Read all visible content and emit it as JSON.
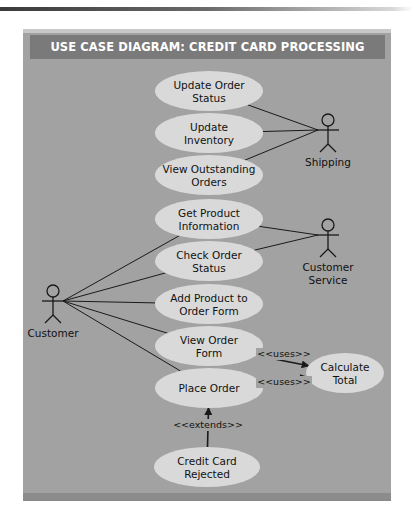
{
  "diagram": {
    "title": "USE CASE DIAGRAM: CREDIT CARD PROCESSING",
    "colors": {
      "frame": "#a2a2a2",
      "title_bar": "#7a7a7a",
      "title_text": "#ffffff",
      "use_case_fill": "#d9d9d9",
      "line": "#1a1a1a"
    },
    "actors": [
      {
        "id": "shipping",
        "label_lines": [
          "Shipping"
        ]
      },
      {
        "id": "customer-service",
        "label_lines": [
          "Customer",
          "Service"
        ]
      },
      {
        "id": "customer",
        "label_lines": [
          "Customer"
        ]
      }
    ],
    "use_cases": [
      {
        "id": "update-order-status",
        "label_lines": [
          "Update Order",
          "Status"
        ]
      },
      {
        "id": "update-inventory",
        "label_lines": [
          "Update",
          "Inventory"
        ]
      },
      {
        "id": "view-outstanding-orders",
        "label_lines": [
          "View Outstanding",
          "Orders"
        ]
      },
      {
        "id": "get-product-information",
        "label_lines": [
          "Get Product",
          "Information"
        ]
      },
      {
        "id": "check-order-status",
        "label_lines": [
          "Check Order",
          "Status"
        ]
      },
      {
        "id": "add-product-to-order-form",
        "label_lines": [
          "Add Product to",
          "Order Form"
        ]
      },
      {
        "id": "view-order-form",
        "label_lines": [
          "View Order",
          "Form"
        ]
      },
      {
        "id": "place-order",
        "label_lines": [
          "Place Order"
        ]
      },
      {
        "id": "calculate-total",
        "label_lines": [
          "Calculate",
          "Total"
        ]
      },
      {
        "id": "credit-card-rejected",
        "label_lines": [
          "Credit Card",
          "Rejected"
        ]
      }
    ],
    "associations": [
      {
        "from": "shipping",
        "to": "update-order-status"
      },
      {
        "from": "shipping",
        "to": "update-inventory"
      },
      {
        "from": "shipping",
        "to": "view-outstanding-orders"
      },
      {
        "from": "customer-service",
        "to": "get-product-information"
      },
      {
        "from": "customer-service",
        "to": "check-order-status"
      },
      {
        "from": "customer",
        "to": "get-product-information"
      },
      {
        "from": "customer",
        "to": "check-order-status"
      },
      {
        "from": "customer",
        "to": "add-product-to-order-form"
      },
      {
        "from": "customer",
        "to": "view-order-form"
      },
      {
        "from": "customer",
        "to": "place-order"
      }
    ],
    "dependencies": [
      {
        "from": "view-order-form",
        "to": "calculate-total",
        "stereotype": "<<uses>>"
      },
      {
        "from": "place-order",
        "to": "calculate-total",
        "stereotype": "<<uses>>"
      },
      {
        "from": "credit-card-rejected",
        "to": "place-order",
        "stereotype": "<<extends>>"
      }
    ]
  }
}
